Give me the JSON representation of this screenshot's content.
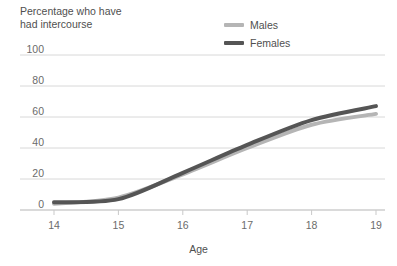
{
  "title": "Percentage who have\nhad intercourse",
  "legend": {
    "position": "top-center",
    "entries": [
      {
        "label": "Males",
        "color": "#b5b5b5",
        "icon": "line-swatch-icon"
      },
      {
        "label": "Females",
        "color": "#555555",
        "icon": "line-swatch-icon"
      }
    ]
  },
  "chart_data": {
    "type": "line",
    "title": "Percentage who have had intercourse",
    "xlabel": "Age",
    "ylabel": "",
    "x": [
      14,
      15,
      16,
      17,
      18,
      19
    ],
    "xticklabels": [
      "14",
      "15",
      "16",
      "17",
      "18",
      "19"
    ],
    "yticklabels": [
      "0",
      "20",
      "40",
      "60",
      "80",
      "100"
    ],
    "yticks": [
      0,
      20,
      40,
      60,
      80,
      100
    ],
    "xlim": [
      14,
      19
    ],
    "ylim": [
      0,
      100
    ],
    "grid": "horizontal",
    "legend_position": "top-center",
    "series": [
      {
        "name": "Males",
        "color": "#b5b5b5",
        "values": [
          4,
          8,
          23,
          40,
          55,
          62
        ]
      },
      {
        "name": "Females",
        "color": "#555555",
        "values": [
          5,
          7,
          24,
          42,
          58,
          67
        ]
      }
    ]
  }
}
